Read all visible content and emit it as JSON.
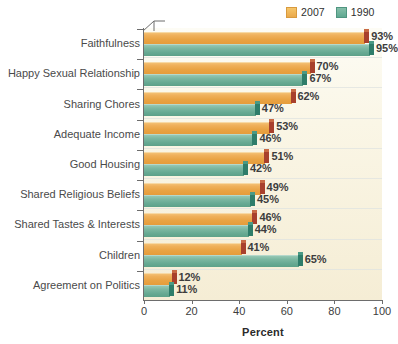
{
  "chart_data": {
    "type": "bar",
    "orientation": "horizontal",
    "title": "",
    "subtitle": "",
    "xlabel": "Percent",
    "ylabel": "",
    "xlim": [
      0,
      100
    ],
    "xticks": [
      0,
      20,
      40,
      60,
      80,
      100
    ],
    "grid": true,
    "grid_orientation": "horizontal-separators",
    "legend_position": "top-right",
    "categories": [
      "Faithfulness",
      "Happy Sexual Relationship",
      "Sharing Chores",
      "Adequate Income",
      "Good Housing",
      "Shared Religious Beliefs",
      "Shared Tastes & Interests",
      "Children",
      "Agreement on Politics"
    ],
    "series": [
      {
        "name": "2007",
        "color": "#eaa94b",
        "values": [
          93,
          70,
          62,
          53,
          51,
          49,
          46,
          41,
          12
        ],
        "labels": [
          "93%",
          "70%",
          "62%",
          "53%",
          "51%",
          "49%",
          "46%",
          "41%",
          "12%"
        ]
      },
      {
        "name": "1990",
        "color": "#66a992",
        "values": [
          95,
          67,
          47,
          46,
          42,
          45,
          44,
          65,
          11
        ],
        "labels": [
          "95%",
          "67%",
          "47%",
          "46%",
          "42%",
          "45%",
          "44%",
          "65%",
          "11%"
        ]
      }
    ]
  },
  "legend": {
    "items": [
      {
        "label": "2007",
        "swatch": "legend-swatch-2007"
      },
      {
        "label": "1990",
        "swatch": "legend-swatch-1990"
      }
    ]
  },
  "axis": {
    "x_title": "Percent",
    "x_tick_labels": [
      "0",
      "20",
      "40",
      "60",
      "80",
      "100"
    ]
  },
  "colors": {
    "series_2007": "#eaa94b",
    "series_1990": "#66a992",
    "cap_2007": "#a8402c",
    "cap_1990": "#2e7d6a",
    "plot_background": "#f7f0dc",
    "page_background": "#ffffff",
    "axis_line": "#6d6d6d",
    "text": "#3d3d3d"
  }
}
